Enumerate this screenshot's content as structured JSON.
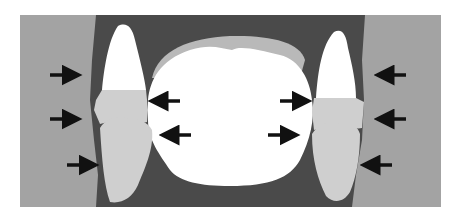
{
  "diagram": {
    "type": "dental occlusion cross-section schematic",
    "colors": {
      "background": "#ffffff",
      "soft_tissue_outer": "#a3a3a3",
      "bone_dark": "#4a4a4a",
      "tongue_white": "#ffffff",
      "palate_gray": "#b9b9b9",
      "crown_white": "#ffffff",
      "tooth_gray": "#cfcfcf",
      "arrow": "#111111"
    },
    "regions": [
      {
        "name": "left-cheek",
        "label": ""
      },
      {
        "name": "right-cheek",
        "label": ""
      },
      {
        "name": "central-cavity",
        "label": ""
      },
      {
        "name": "left-upper-tooth",
        "label": ""
      },
      {
        "name": "left-lower-tooth",
        "label": ""
      },
      {
        "name": "right-upper-tooth",
        "label": ""
      },
      {
        "name": "right-lower-tooth",
        "label": ""
      }
    ],
    "arrows": {
      "left_outer_count": 3,
      "left_inner_count": 2,
      "right_inner_count": 2,
      "right_outer_count": 3
    }
  }
}
